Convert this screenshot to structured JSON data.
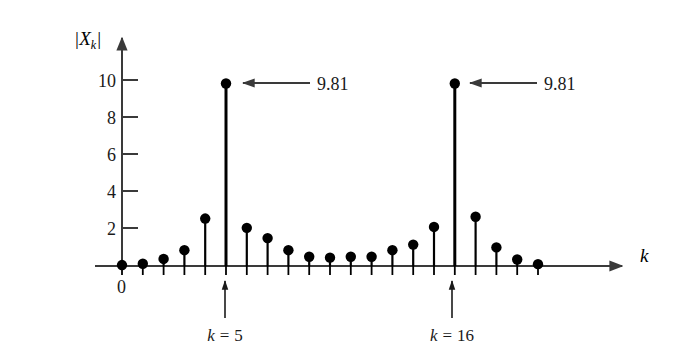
{
  "chart_data": {
    "type": "bar",
    "subtype": "stem",
    "title": "",
    "subtitle": "",
    "xlabel": "k",
    "ylabel": "|X_k|",
    "ylabel_parts": {
      "bar_left": "|",
      "symbol": "X",
      "subscript": "k",
      "bar_right": "|"
    },
    "x": [
      0,
      1,
      2,
      3,
      4,
      5,
      6,
      7,
      8,
      9,
      10,
      11,
      12,
      13,
      14,
      15,
      16,
      17,
      18,
      19,
      20
    ],
    "values": [
      0.05,
      0.12,
      0.38,
      0.85,
      2.55,
      9.81,
      2.05,
      1.5,
      0.85,
      0.5,
      0.45,
      0.5,
      0.5,
      0.85,
      1.15,
      2.1,
      9.81,
      2.65,
      1.0,
      0.35,
      0.1
    ],
    "categories": [
      "0",
      "1",
      "2",
      "3",
      "4",
      "5",
      "6",
      "7",
      "8",
      "9",
      "10",
      "11",
      "12",
      "13",
      "14",
      "15",
      "16",
      "17",
      "18",
      "19",
      "20"
    ],
    "xlim": [
      0,
      20
    ],
    "ylim": [
      0,
      11.2
    ],
    "grid": false,
    "legend": null,
    "yticks": [
      2,
      4,
      6,
      8,
      10
    ],
    "ytick_labels": [
      "2",
      "4",
      "6",
      "8",
      "10"
    ],
    "xticks_labeled": [
      "0"
    ],
    "origin_label": "0",
    "annotations": [
      {
        "id": "peak-1",
        "text": "9.81",
        "x_index": 5,
        "value": 9.81,
        "arrow": "left"
      },
      {
        "id": "peak-2",
        "text": "9.81",
        "x_index": 16,
        "value": 9.81,
        "arrow": "left"
      }
    ],
    "axis_markers": [
      {
        "id": "marker-k5",
        "label_prefix": "k",
        "label_eq": "=",
        "label_value": "5",
        "text": "k = 5",
        "x_index": 5,
        "arrow": "up"
      },
      {
        "id": "marker-k16",
        "label_prefix": "k",
        "label_eq": "=",
        "label_value": "16",
        "text": "k = 16",
        "x_index": 16,
        "arrow": "up"
      }
    ],
    "colors": {
      "stem": "#000000",
      "marker": "#000000",
      "axis": "#3a3a3a",
      "text": "#1a1a1a",
      "background": "#ffffff"
    }
  }
}
